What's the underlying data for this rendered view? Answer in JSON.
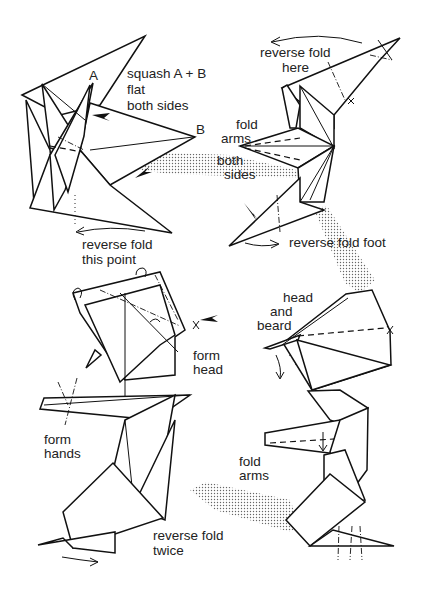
{
  "diagram": {
    "type": "origami-folding-instructions",
    "steps": [
      {
        "id": "step-1",
        "position": "top-left",
        "labels": {
          "point_a": "A",
          "point_b": "B",
          "instruction_line1": "squash A + B",
          "instruction_line2": "flat",
          "instruction_line3": "both sides",
          "bottom_line1": "reverse fold",
          "bottom_line2": "this point"
        }
      },
      {
        "id": "step-2",
        "position": "top-right",
        "labels": {
          "top_line1": "reverse fold",
          "top_line2": "here",
          "arms_line1": "fold",
          "arms_line2": "arms",
          "sides_line1": "both",
          "sides_line2": "sides",
          "foot": "reverse fold foot"
        }
      },
      {
        "id": "step-3",
        "position": "bottom-right",
        "labels": {
          "head_line1": "head",
          "head_line2": "and",
          "head_line3": "beard",
          "arms_line1": "fold",
          "arms_line2": "arms"
        }
      },
      {
        "id": "step-4",
        "position": "bottom-left",
        "labels": {
          "head_line1": "form",
          "head_line2": "head",
          "hands_line1": "form",
          "hands_line2": "hands",
          "bottom_line1": "reverse fold",
          "bottom_line2": "twice"
        }
      }
    ],
    "connectors": [
      "step-1 to step-2",
      "step-2 to step-3",
      "step-3 to step-4"
    ]
  }
}
